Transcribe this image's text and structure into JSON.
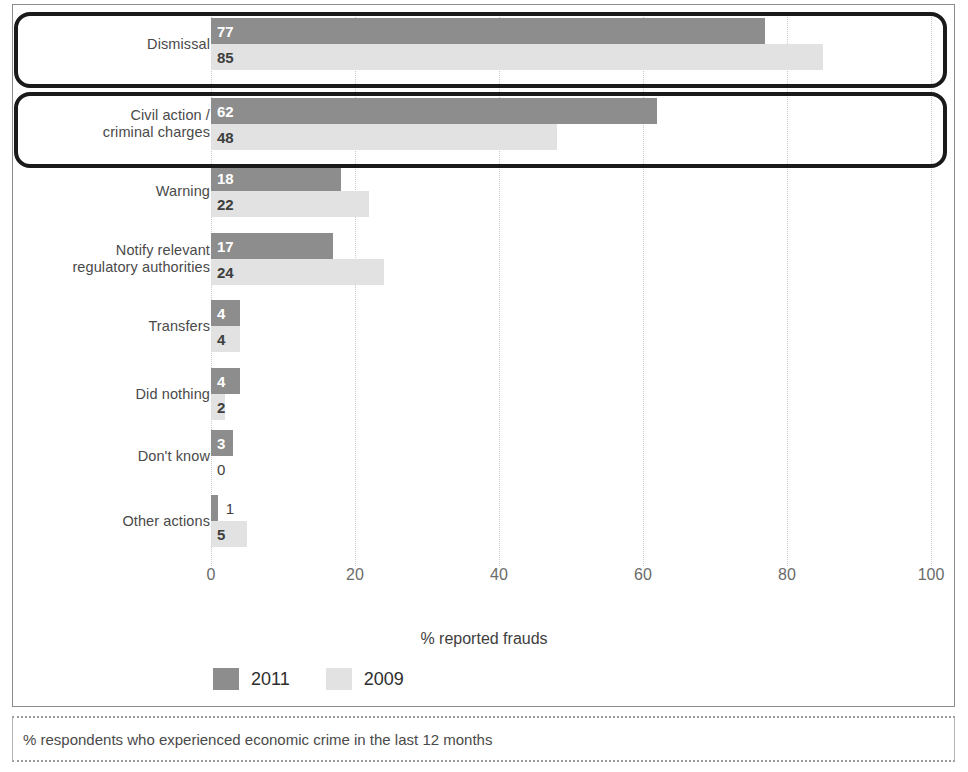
{
  "chart_data": {
    "type": "bar",
    "orientation": "horizontal",
    "title": "",
    "xlabel": "% reported frauds",
    "ylabel": "",
    "xlim": [
      0,
      100
    ],
    "xticks": [
      0,
      20,
      40,
      60,
      80,
      100
    ],
    "grid": true,
    "legend_position": "bottom-left",
    "categories": [
      "Dismissal",
      "Civil action / criminal charges",
      "Warning",
      "Notify relevant regulatory authorities",
      "Transfers",
      "Did nothing",
      "Don't know",
      "Other actions"
    ],
    "series": [
      {
        "name": "2011",
        "color": "#8d8d8d",
        "values": [
          77,
          62,
          18,
          17,
          4,
          4,
          3,
          1
        ]
      },
      {
        "name": "2009",
        "color": "#e2e2e2",
        "values": [
          85,
          48,
          22,
          24,
          4,
          2,
          0,
          5
        ]
      }
    ]
  },
  "rows": [
    {
      "label_lines": [
        "Dismissal"
      ],
      "highlighted": true,
      "bars": [
        {
          "series": "2011",
          "value": 77,
          "value_text": "77",
          "style": "dark",
          "label_inside": true
        },
        {
          "series": "2009",
          "value": 85,
          "value_text": "85",
          "style": "light",
          "label_inside": true
        }
      ]
    },
    {
      "label_lines": [
        "Civil action /",
        "criminal charges"
      ],
      "highlighted": true,
      "bars": [
        {
          "series": "2011",
          "value": 62,
          "value_text": "62",
          "style": "dark",
          "label_inside": true
        },
        {
          "series": "2009",
          "value": 48,
          "value_text": "48",
          "style": "light",
          "label_inside": true
        }
      ]
    },
    {
      "label_lines": [
        "Warning"
      ],
      "highlighted": false,
      "bars": [
        {
          "series": "2011",
          "value": 18,
          "value_text": "18",
          "style": "dark",
          "label_inside": true
        },
        {
          "series": "2009",
          "value": 22,
          "value_text": "22",
          "style": "light",
          "label_inside": true
        }
      ]
    },
    {
      "label_lines": [
        "Notify relevant",
        "regulatory authorities"
      ],
      "highlighted": false,
      "bars": [
        {
          "series": "2011",
          "value": 17,
          "value_text": "17",
          "style": "dark",
          "label_inside": true
        },
        {
          "series": "2009",
          "value": 24,
          "value_text": "24",
          "style": "light",
          "label_inside": true
        }
      ]
    },
    {
      "label_lines": [
        "Transfers"
      ],
      "highlighted": false,
      "bars": [
        {
          "series": "2011",
          "value": 4,
          "value_text": "4",
          "style": "dark",
          "label_inside": true
        },
        {
          "series": "2009",
          "value": 4,
          "value_text": "4",
          "style": "light",
          "label_inside": true
        }
      ]
    },
    {
      "label_lines": [
        "Did nothing"
      ],
      "highlighted": false,
      "bars": [
        {
          "series": "2011",
          "value": 4,
          "value_text": "4",
          "style": "dark",
          "label_inside": true
        },
        {
          "series": "2009",
          "value": 2,
          "value_text": "2",
          "style": "light",
          "label_inside": true
        }
      ]
    },
    {
      "label_lines": [
        "Don't know"
      ],
      "highlighted": false,
      "bars": [
        {
          "series": "2011",
          "value": 3,
          "value_text": "3",
          "style": "dark",
          "label_inside": true
        },
        {
          "series": "2009",
          "value": 0,
          "value_text": "0",
          "style": "zero",
          "label_inside": false
        }
      ]
    },
    {
      "label_lines": [
        "Other actions"
      ],
      "highlighted": false,
      "bars": [
        {
          "series": "2011",
          "value": 1,
          "value_text": "1",
          "style": "dark",
          "label_inside": false
        },
        {
          "series": "2009",
          "value": 5,
          "value_text": "5",
          "style": "light",
          "label_inside": true
        }
      ]
    }
  ],
  "axis": {
    "ticks": [
      "0",
      "20",
      "40",
      "60",
      "80",
      "100"
    ],
    "title": "% reported frauds"
  },
  "legend": {
    "items": [
      {
        "label": "2011",
        "color": "#8d8d8d"
      },
      {
        "label": "2009",
        "color": "#e2e2e2"
      }
    ]
  },
  "footer": {
    "note": "% respondents who experienced economic crime in the last 12 months"
  },
  "colors": {
    "series_2011": "#8d8d8d",
    "series_2009": "#e2e2e2",
    "highlight_border": "#1a1a1a",
    "frame": "#8c8c8c",
    "gridline": "#c9c9c9",
    "text": "#4a4a4a"
  }
}
